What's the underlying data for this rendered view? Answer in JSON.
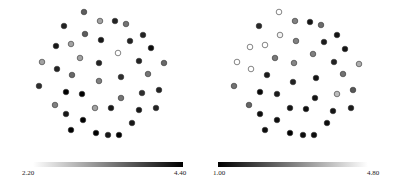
{
  "chart_data": [
    {
      "type": "scatter",
      "title": "",
      "xlabel": "",
      "ylabel": "",
      "grid": false,
      "axes_visible": false,
      "colormap": "gray_r (light = low, dark = high)",
      "colorbar": {
        "min": 2.2,
        "max": 4.4,
        "min_label": "2.20",
        "max_label": "4.40",
        "position": "bottom",
        "low_color": "#ffffff",
        "high_color": "#000000"
      },
      "points": [
        {
          "x": 84,
          "y": 12,
          "value": 3.6
        },
        {
          "x": 100,
          "y": 21,
          "value": 3.0
        },
        {
          "x": 115,
          "y": 21,
          "value": 4.1
        },
        {
          "x": 126,
          "y": 24,
          "value": 3.4
        },
        {
          "x": 64,
          "y": 26,
          "value": 4.1
        },
        {
          "x": 85,
          "y": 34,
          "value": 3.6
        },
        {
          "x": 143,
          "y": 35,
          "value": 4.1
        },
        {
          "x": 101,
          "y": 40,
          "value": 4.2
        },
        {
          "x": 130,
          "y": 41,
          "value": 4.1
        },
        {
          "x": 71,
          "y": 44,
          "value": 3.0
        },
        {
          "x": 56,
          "y": 46,
          "value": 4.2
        },
        {
          "x": 151,
          "y": 48,
          "value": 4.3
        },
        {
          "x": 118,
          "y": 53,
          "value": 2.2
        },
        {
          "x": 80,
          "y": 58,
          "value": 3.0
        },
        {
          "x": 42,
          "y": 62,
          "value": 3.0
        },
        {
          "x": 99,
          "y": 63,
          "value": 4.1
        },
        {
          "x": 139,
          "y": 61,
          "value": 4.1
        },
        {
          "x": 164,
          "y": 63,
          "value": 3.5
        },
        {
          "x": 57,
          "y": 69,
          "value": 4.1
        },
        {
          "x": 72,
          "y": 75,
          "value": 3.5
        },
        {
          "x": 148,
          "y": 74,
          "value": 3.4
        },
        {
          "x": 121,
          "y": 77,
          "value": 4.0
        },
        {
          "x": 99,
          "y": 81,
          "value": 3.3
        },
        {
          "x": 39,
          "y": 86,
          "value": 4.0
        },
        {
          "x": 66,
          "y": 92,
          "value": 4.4
        },
        {
          "x": 82,
          "y": 94,
          "value": 4.4
        },
        {
          "x": 159,
          "y": 90,
          "value": 4.1
        },
        {
          "x": 142,
          "y": 93,
          "value": 4.0
        },
        {
          "x": 121,
          "y": 98,
          "value": 3.4
        },
        {
          "x": 55,
          "y": 105,
          "value": 3.3
        },
        {
          "x": 95,
          "y": 108,
          "value": 3.0
        },
        {
          "x": 111,
          "y": 108,
          "value": 4.2
        },
        {
          "x": 156,
          "y": 108,
          "value": 4.1
        },
        {
          "x": 139,
          "y": 110,
          "value": 4.2
        },
        {
          "x": 66,
          "y": 114,
          "value": 4.2
        },
        {
          "x": 83,
          "y": 120,
          "value": 4.4
        },
        {
          "x": 132,
          "y": 123,
          "value": 4.2
        },
        {
          "x": 71,
          "y": 130,
          "value": 4.4
        },
        {
          "x": 96,
          "y": 133,
          "value": 4.4
        },
        {
          "x": 108,
          "y": 135,
          "value": 4.2
        },
        {
          "x": 119,
          "y": 135,
          "value": 4.4
        }
      ]
    },
    {
      "type": "scatter",
      "title": "",
      "xlabel": "",
      "ylabel": "",
      "grid": false,
      "axes_visible": false,
      "colormap": "gray (dark = low, light = high)",
      "colorbar": {
        "min": 1.0,
        "max": 4.8,
        "min_label": "1.00",
        "max_label": "4.80",
        "position": "bottom",
        "low_color": "#000000",
        "high_color": "#ffffff"
      },
      "points": [
        {
          "x": 80,
          "y": 12,
          "value": 4.8
        },
        {
          "x": 96,
          "y": 21,
          "value": 2.9
        },
        {
          "x": 111,
          "y": 22,
          "value": 1.3
        },
        {
          "x": 122,
          "y": 25,
          "value": 2.6
        },
        {
          "x": 60,
          "y": 26,
          "value": 1.6
        },
        {
          "x": 81,
          "y": 35,
          "value": 4.6
        },
        {
          "x": 138,
          "y": 35,
          "value": 1.3
        },
        {
          "x": 97,
          "y": 41,
          "value": 2.9
        },
        {
          "x": 125,
          "y": 42,
          "value": 1.4
        },
        {
          "x": 66,
          "y": 45,
          "value": 4.8
        },
        {
          "x": 51,
          "y": 47,
          "value": 4.8
        },
        {
          "x": 146,
          "y": 49,
          "value": 1.3
        },
        {
          "x": 114,
          "y": 54,
          "value": 2.9
        },
        {
          "x": 76,
          "y": 58,
          "value": 2.8
        },
        {
          "x": 38,
          "y": 62,
          "value": 4.8
        },
        {
          "x": 95,
          "y": 63,
          "value": 3.0
        },
        {
          "x": 135,
          "y": 62,
          "value": 1.5
        },
        {
          "x": 160,
          "y": 64,
          "value": 3.6
        },
        {
          "x": 52,
          "y": 69,
          "value": 4.8
        },
        {
          "x": 68,
          "y": 75,
          "value": 1.4
        },
        {
          "x": 144,
          "y": 74,
          "value": 2.7
        },
        {
          "x": 117,
          "y": 78,
          "value": 1.3
        },
        {
          "x": 94,
          "y": 82,
          "value": 1.5
        },
        {
          "x": 35,
          "y": 86,
          "value": 2.7
        },
        {
          "x": 61,
          "y": 92,
          "value": 1.1
        },
        {
          "x": 78,
          "y": 94,
          "value": 1.4
        },
        {
          "x": 154,
          "y": 90,
          "value": 2.3
        },
        {
          "x": 138,
          "y": 94,
          "value": 3.8
        },
        {
          "x": 116,
          "y": 98,
          "value": 1.3
        },
        {
          "x": 50,
          "y": 105,
          "value": 2.5
        },
        {
          "x": 91,
          "y": 108,
          "value": 1.3
        },
        {
          "x": 107,
          "y": 109,
          "value": 1.2
        },
        {
          "x": 152,
          "y": 108,
          "value": 1.4
        },
        {
          "x": 134,
          "y": 111,
          "value": 1.3
        },
        {
          "x": 61,
          "y": 114,
          "value": 1.2
        },
        {
          "x": 78,
          "y": 120,
          "value": 1.2
        },
        {
          "x": 128,
          "y": 123,
          "value": 1.2
        },
        {
          "x": 66,
          "y": 130,
          "value": 1.2
        },
        {
          "x": 91,
          "y": 133,
          "value": 1.0
        },
        {
          "x": 104,
          "y": 135,
          "value": 1.2
        },
        {
          "x": 115,
          "y": 135,
          "value": 1.2
        }
      ]
    }
  ]
}
